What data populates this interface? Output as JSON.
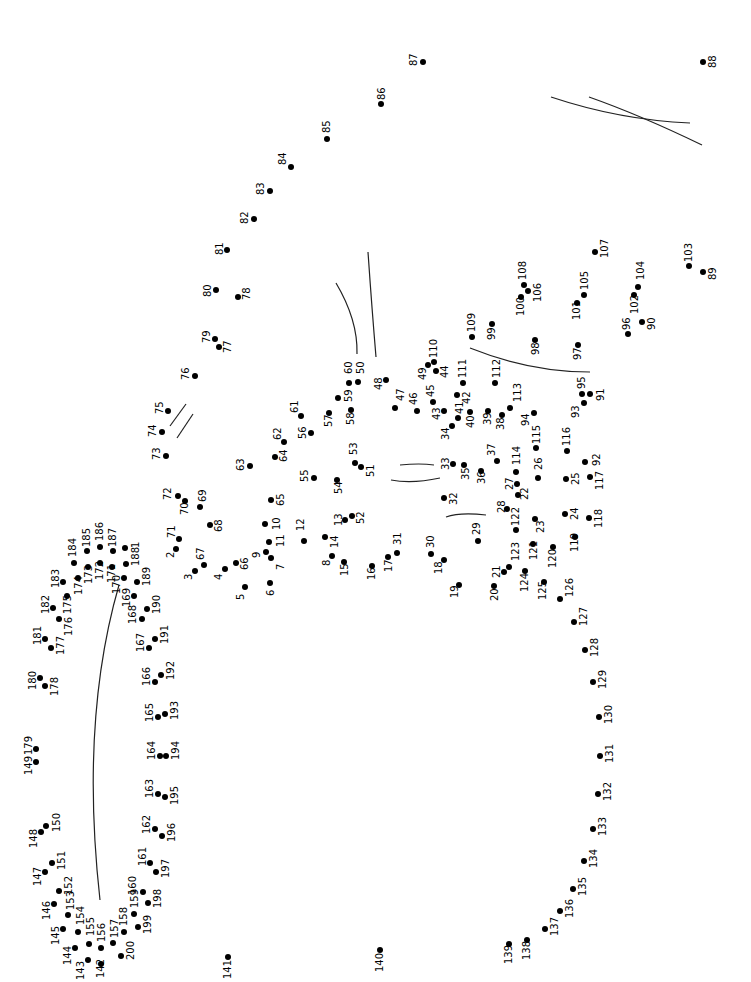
{
  "total_dots": 200,
  "colors": {
    "dot": "#000000",
    "line": "#222222",
    "background": "#ffffff"
  },
  "label_rotation_deg": -90,
  "dots": [
    {
      "n": "1",
      "x": 125,
      "y": 548,
      "lx": 131,
      "ly": 548
    },
    {
      "n": "2",
      "x": 176,
      "y": 549,
      "lx": 166,
      "ly": 558
    },
    {
      "n": "3",
      "x": 195,
      "y": 571,
      "lx": 184,
      "ly": 580
    },
    {
      "n": "4",
      "x": 225,
      "y": 569,
      "lx": 214,
      "ly": 580
    },
    {
      "n": "5",
      "x": 245,
      "y": 587,
      "lx": 236,
      "ly": 600
    },
    {
      "n": "6",
      "x": 270,
      "y": 583,
      "lx": 266,
      "ly": 596
    },
    {
      "n": "7",
      "x": 271,
      "y": 558,
      "lx": 276,
      "ly": 570
    },
    {
      "n": "8",
      "x": 332,
      "y": 556,
      "lx": 322,
      "ly": 566
    },
    {
      "n": "9",
      "x": 266,
      "y": 552,
      "lx": 252,
      "ly": 558
    },
    {
      "n": "10",
      "x": 265,
      "y": 524,
      "lx": 272,
      "ly": 530
    },
    {
      "n": "11",
      "x": 269,
      "y": 542,
      "lx": 276,
      "ly": 547
    },
    {
      "n": "12",
      "x": 304,
      "y": 541,
      "lx": 296,
      "ly": 531
    },
    {
      "n": "13",
      "x": 345,
      "y": 520,
      "lx": 334,
      "ly": 526
    },
    {
      "n": "14",
      "x": 325,
      "y": 537,
      "lx": 330,
      "ly": 548
    },
    {
      "n": "15",
      "x": 344,
      "y": 562,
      "lx": 340,
      "ly": 576
    },
    {
      "n": "16",
      "x": 372,
      "y": 566,
      "lx": 367,
      "ly": 580
    },
    {
      "n": "17",
      "x": 388,
      "y": 557,
      "lx": 384,
      "ly": 572
    },
    {
      "n": "18",
      "x": 444,
      "y": 560,
      "lx": 434,
      "ly": 574
    },
    {
      "n": "19",
      "x": 459,
      "y": 585,
      "lx": 450,
      "ly": 598
    },
    {
      "n": "20",
      "x": 494,
      "y": 586,
      "lx": 490,
      "ly": 601
    },
    {
      "n": "21",
      "x": 504,
      "y": 572,
      "lx": 492,
      "ly": 578
    },
    {
      "n": "22",
      "x": 518,
      "y": 495,
      "lx": 520,
      "ly": 500
    },
    {
      "n": "23",
      "x": 535,
      "y": 519,
      "lx": 536,
      "ly": 533
    },
    {
      "n": "24",
      "x": 565,
      "y": 514,
      "lx": 570,
      "ly": 520
    },
    {
      "n": "25",
      "x": 566,
      "y": 479,
      "lx": 571,
      "ly": 485
    },
    {
      "n": "26",
      "x": 538,
      "y": 478,
      "lx": 534,
      "ly": 470
    },
    {
      "n": "27",
      "x": 517,
      "y": 484,
      "lx": 505,
      "ly": 490
    },
    {
      "n": "28",
      "x": 507,
      "y": 509,
      "lx": 497,
      "ly": 513
    },
    {
      "n": "29",
      "x": 478,
      "y": 541,
      "lx": 472,
      "ly": 535
    },
    {
      "n": "30",
      "x": 431,
      "y": 554,
      "lx": 426,
      "ly": 548
    },
    {
      "n": "31",
      "x": 397,
      "y": 553,
      "lx": 393,
      "ly": 545
    },
    {
      "n": "32",
      "x": 444,
      "y": 498,
      "lx": 449,
      "ly": 505
    },
    {
      "n": "33",
      "x": 453,
      "y": 464,
      "lx": 441,
      "ly": 470
    },
    {
      "n": "34",
      "x": 452,
      "y": 426,
      "lx": 441,
      "ly": 440
    },
    {
      "n": "35",
      "x": 464,
      "y": 465,
      "lx": 461,
      "ly": 480
    },
    {
      "n": "36",
      "x": 481,
      "y": 471,
      "lx": 477,
      "ly": 484
    },
    {
      "n": "37",
      "x": 497,
      "y": 461,
      "lx": 487,
      "ly": 456
    },
    {
      "n": "38",
      "x": 502,
      "y": 415,
      "lx": 496,
      "ly": 430
    },
    {
      "n": "39",
      "x": 488,
      "y": 411,
      "lx": 483,
      "ly": 425
    },
    {
      "n": "40",
      "x": 470,
      "y": 412,
      "lx": 466,
      "ly": 428
    },
    {
      "n": "41",
      "x": 458,
      "y": 418,
      "lx": 455,
      "ly": 414
    },
    {
      "n": "42",
      "x": 457,
      "y": 395,
      "lx": 462,
      "ly": 404
    },
    {
      "n": "43",
      "x": 444,
      "y": 411,
      "lx": 432,
      "ly": 420
    },
    {
      "n": "44",
      "x": 436,
      "y": 371,
      "lx": 440,
      "ly": 378
    },
    {
      "n": "45",
      "x": 433,
      "y": 402,
      "lx": 426,
      "ly": 397
    },
    {
      "n": "46",
      "x": 417,
      "y": 411,
      "lx": 409,
      "ly": 405
    },
    {
      "n": "47",
      "x": 395,
      "y": 408,
      "lx": 396,
      "ly": 401
    },
    {
      "n": "48",
      "x": 386,
      "y": 380,
      "lx": 374,
      "ly": 390
    },
    {
      "n": "49",
      "x": 428,
      "y": 365,
      "lx": 418,
      "ly": 380
    },
    {
      "n": "50",
      "x": 358,
      "y": 382,
      "lx": 356,
      "ly": 374
    },
    {
      "n": "51",
      "x": 361,
      "y": 467,
      "lx": 366,
      "ly": 477
    },
    {
      "n": "52",
      "x": 352,
      "y": 516,
      "lx": 356,
      "ly": 524
    },
    {
      "n": "53",
      "x": 355,
      "y": 463,
      "lx": 349,
      "ly": 455
    },
    {
      "n": "54",
      "x": 337,
      "y": 480,
      "lx": 334,
      "ly": 494
    },
    {
      "n": "55",
      "x": 314,
      "y": 478,
      "lx": 300,
      "ly": 482
    },
    {
      "n": "56",
      "x": 311,
      "y": 433,
      "lx": 298,
      "ly": 439
    },
    {
      "n": "57",
      "x": 329,
      "y": 413,
      "lx": 324,
      "ly": 427
    },
    {
      "n": "58",
      "x": 351,
      "y": 410,
      "lx": 346,
      "ly": 425
    },
    {
      "n": "59",
      "x": 338,
      "y": 398,
      "lx": 344,
      "ly": 402
    },
    {
      "n": "60",
      "x": 349,
      "y": 383,
      "lx": 344,
      "ly": 374
    },
    {
      "n": "61",
      "x": 301,
      "y": 416,
      "lx": 290,
      "ly": 413
    },
    {
      "n": "62",
      "x": 284,
      "y": 442,
      "lx": 273,
      "ly": 440
    },
    {
      "n": "63",
      "x": 250,
      "y": 466,
      "lx": 236,
      "ly": 471
    },
    {
      "n": "64",
      "x": 275,
      "y": 457,
      "lx": 279,
      "ly": 462
    },
    {
      "n": "65",
      "x": 271,
      "y": 500,
      "lx": 276,
      "ly": 506
    },
    {
      "n": "66",
      "x": 236,
      "y": 563,
      "lx": 240,
      "ly": 570
    },
    {
      "n": "67",
      "x": 204,
      "y": 565,
      "lx": 196,
      "ly": 560
    },
    {
      "n": "68",
      "x": 210,
      "y": 525,
      "lx": 214,
      "ly": 532
    },
    {
      "n": "69",
      "x": 200,
      "y": 507,
      "lx": 198,
      "ly": 502
    },
    {
      "n": "70",
      "x": 185,
      "y": 501,
      "lx": 180,
      "ly": 515
    },
    {
      "n": "71",
      "x": 179,
      "y": 539,
      "lx": 167,
      "ly": 538
    },
    {
      "n": "72",
      "x": 178,
      "y": 496,
      "lx": 163,
      "ly": 500
    },
    {
      "n": "73",
      "x": 166,
      "y": 456,
      "lx": 152,
      "ly": 460
    },
    {
      "n": "74",
      "x": 162,
      "y": 432,
      "lx": 148,
      "ly": 437
    },
    {
      "n": "75",
      "x": 168,
      "y": 411,
      "lx": 155,
      "ly": 414
    },
    {
      "n": "76",
      "x": 195,
      "y": 376,
      "lx": 181,
      "ly": 380
    },
    {
      "n": "77",
      "x": 219,
      "y": 347,
      "lx": 223,
      "ly": 353
    },
    {
      "n": "78",
      "x": 238,
      "y": 297,
      "lx": 242,
      "ly": 300
    },
    {
      "n": "79",
      "x": 215,
      "y": 339,
      "lx": 202,
      "ly": 343
    },
    {
      "n": "80",
      "x": 216,
      "y": 290,
      "lx": 203,
      "ly": 297
    },
    {
      "n": "81",
      "x": 227,
      "y": 250,
      "lx": 215,
      "ly": 255
    },
    {
      "n": "82",
      "x": 254,
      "y": 219,
      "lx": 240,
      "ly": 224
    },
    {
      "n": "83",
      "x": 270,
      "y": 191,
      "lx": 256,
      "ly": 195
    },
    {
      "n": "84",
      "x": 291,
      "y": 167,
      "lx": 278,
      "ly": 165
    },
    {
      "n": "85",
      "x": 327,
      "y": 139,
      "lx": 322,
      "ly": 133
    },
    {
      "n": "86",
      "x": 381,
      "y": 104,
      "lx": 377,
      "ly": 100
    },
    {
      "n": "87",
      "x": 423,
      "y": 62,
      "lx": 409,
      "ly": 66
    },
    {
      "n": "88",
      "x": 703,
      "y": 62,
      "lx": 708,
      "ly": 68
    },
    {
      "n": "89",
      "x": 703,
      "y": 272,
      "lx": 708,
      "ly": 280
    },
    {
      "n": "90",
      "x": 642,
      "y": 322,
      "lx": 647,
      "ly": 330
    },
    {
      "n": "91",
      "x": 590,
      "y": 394,
      "lx": 596,
      "ly": 401
    },
    {
      "n": "92",
      "x": 585,
      "y": 462,
      "lx": 592,
      "ly": 466
    },
    {
      "n": "93",
      "x": 584,
      "y": 403,
      "lx": 571,
      "ly": 418
    },
    {
      "n": "94",
      "x": 534,
      "y": 413,
      "lx": 521,
      "ly": 426
    },
    {
      "n": "95",
      "x": 582,
      "y": 394,
      "lx": 577,
      "ly": 389
    },
    {
      "n": "96",
      "x": 628,
      "y": 334,
      "lx": 622,
      "ly": 330
    },
    {
      "n": "97",
      "x": 578,
      "y": 345,
      "lx": 573,
      "ly": 360
    },
    {
      "n": "98",
      "x": 535,
      "y": 340,
      "lx": 531,
      "ly": 355
    },
    {
      "n": "99",
      "x": 492,
      "y": 324,
      "lx": 487,
      "ly": 340
    },
    {
      "n": "100",
      "x": 521,
      "y": 297,
      "lx": 516,
      "ly": 316
    },
    {
      "n": "101",
      "x": 577,
      "y": 303,
      "lx": 572,
      "ly": 320
    },
    {
      "n": "102",
      "x": 634,
      "y": 295,
      "lx": 630,
      "ly": 314
    },
    {
      "n": "103",
      "x": 689,
      "y": 266,
      "lx": 684,
      "ly": 262
    },
    {
      "n": "104",
      "x": 638,
      "y": 287,
      "lx": 636,
      "ly": 280
    },
    {
      "n": "105",
      "x": 584,
      "y": 295,
      "lx": 580,
      "ly": 290
    },
    {
      "n": "106",
      "x": 528,
      "y": 291,
      "lx": 533,
      "ly": 302
    },
    {
      "n": "107",
      "x": 595,
      "y": 252,
      "lx": 600,
      "ly": 258
    },
    {
      "n": "108",
      "x": 524,
      "y": 285,
      "lx": 518,
      "ly": 280
    },
    {
      "n": "109",
      "x": 472,
      "y": 337,
      "lx": 467,
      "ly": 332
    },
    {
      "n": "110",
      "x": 434,
      "y": 362,
      "lx": 429,
      "ly": 358
    },
    {
      "n": "111",
      "x": 463,
      "y": 383,
      "lx": 458,
      "ly": 378
    },
    {
      "n": "112",
      "x": 495,
      "y": 383,
      "lx": 492,
      "ly": 378
    },
    {
      "n": "113",
      "x": 510,
      "y": 408,
      "lx": 513,
      "ly": 402
    },
    {
      "n": "114",
      "x": 516,
      "y": 472,
      "lx": 512,
      "ly": 465
    },
    {
      "n": "115",
      "x": 536,
      "y": 448,
      "lx": 532,
      "ly": 444
    },
    {
      "n": "116",
      "x": 567,
      "y": 451,
      "lx": 562,
      "ly": 446
    },
    {
      "n": "117",
      "x": 590,
      "y": 477,
      "lx": 595,
      "ly": 490
    },
    {
      "n": "118",
      "x": 589,
      "y": 518,
      "lx": 594,
      "ly": 528
    },
    {
      "n": "119",
      "x": 575,
      "y": 537,
      "lx": 570,
      "ly": 552
    },
    {
      "n": "120",
      "x": 553,
      "y": 547,
      "lx": 548,
      "ly": 568
    },
    {
      "n": "121",
      "x": 533,
      "y": 544,
      "lx": 529,
      "ly": 560
    },
    {
      "n": "122",
      "x": 516,
      "y": 530,
      "lx": 511,
      "ly": 526
    },
    {
      "n": "123",
      "x": 509,
      "y": 567,
      "lx": 511,
      "ly": 561
    },
    {
      "n": "124",
      "x": 525,
      "y": 571,
      "lx": 520,
      "ly": 592
    },
    {
      "n": "125",
      "x": 544,
      "y": 582,
      "lx": 538,
      "ly": 600
    },
    {
      "n": "126",
      "x": 560,
      "y": 599,
      "lx": 565,
      "ly": 597
    },
    {
      "n": "127",
      "x": 574,
      "y": 622,
      "lx": 579,
      "ly": 626
    },
    {
      "n": "128",
      "x": 585,
      "y": 650,
      "lx": 590,
      "ly": 657
    },
    {
      "n": "129",
      "x": 593,
      "y": 682,
      "lx": 598,
      "ly": 689
    },
    {
      "n": "130",
      "x": 599,
      "y": 717,
      "lx": 604,
      "ly": 724
    },
    {
      "n": "131",
      "x": 600,
      "y": 756,
      "lx": 605,
      "ly": 763
    },
    {
      "n": "132",
      "x": 598,
      "y": 794,
      "lx": 603,
      "ly": 801
    },
    {
      "n": "133",
      "x": 593,
      "y": 829,
      "lx": 598,
      "ly": 836
    },
    {
      "n": "134",
      "x": 584,
      "y": 861,
      "lx": 589,
      "ly": 868
    },
    {
      "n": "135",
      "x": 573,
      "y": 889,
      "lx": 578,
      "ly": 896
    },
    {
      "n": "136",
      "x": 560,
      "y": 911,
      "lx": 565,
      "ly": 918
    },
    {
      "n": "137",
      "x": 545,
      "y": 929,
      "lx": 550,
      "ly": 936
    },
    {
      "n": "138",
      "x": 527,
      "y": 940,
      "lx": 522,
      "ly": 960
    },
    {
      "n": "139",
      "x": 509,
      "y": 944,
      "lx": 504,
      "ly": 964
    },
    {
      "n": "140",
      "x": 380,
      "y": 950,
      "lx": 375,
      "ly": 972
    },
    {
      "n": "141",
      "x": 228,
      "y": 957,
      "lx": 223,
      "ly": 979
    },
    {
      "n": "142",
      "x": 101,
      "y": 964,
      "lx": 96,
      "ly": 978
    },
    {
      "n": "143",
      "x": 88,
      "y": 960,
      "lx": 76,
      "ly": 980
    },
    {
      "n": "144",
      "x": 75,
      "y": 948,
      "lx": 63,
      "ly": 965
    },
    {
      "n": "145",
      "x": 63,
      "y": 929,
      "lx": 51,
      "ly": 945
    },
    {
      "n": "146",
      "x": 54,
      "y": 904,
      "lx": 42,
      "ly": 920
    },
    {
      "n": "147",
      "x": 45,
      "y": 872,
      "lx": 33,
      "ly": 886
    },
    {
      "n": "148",
      "x": 41,
      "y": 832,
      "lx": 29,
      "ly": 848
    },
    {
      "n": "149",
      "x": 36,
      "y": 762,
      "lx": 24,
      "ly": 775
    },
    {
      "n": "150",
      "x": 46,
      "y": 826,
      "lx": 52,
      "ly": 832
    },
    {
      "n": "151",
      "x": 52,
      "y": 863,
      "lx": 57,
      "ly": 870
    },
    {
      "n": "152",
      "x": 59,
      "y": 891,
      "lx": 64,
      "ly": 895
    },
    {
      "n": "153",
      "x": 68,
      "y": 915,
      "lx": 66,
      "ly": 910
    },
    {
      "n": "154",
      "x": 78,
      "y": 932,
      "lx": 76,
      "ly": 925
    },
    {
      "n": "155",
      "x": 89,
      "y": 944,
      "lx": 86,
      "ly": 936
    },
    {
      "n": "156",
      "x": 101,
      "y": 948,
      "lx": 97,
      "ly": 942
    },
    {
      "n": "157",
      "x": 113,
      "y": 943,
      "lx": 110,
      "ly": 938
    },
    {
      "n": "158",
      "x": 124,
      "y": 932,
      "lx": 119,
      "ly": 926
    },
    {
      "n": "159",
      "x": 134,
      "y": 914,
      "lx": 130,
      "ly": 908
    },
    {
      "n": "160",
      "x": 143,
      "y": 892,
      "lx": 128,
      "ly": 895
    },
    {
      "n": "161",
      "x": 150,
      "y": 863,
      "lx": 138,
      "ly": 866
    },
    {
      "n": "162",
      "x": 155,
      "y": 829,
      "lx": 142,
      "ly": 834
    },
    {
      "n": "163",
      "x": 158,
      "y": 794,
      "lx": 145,
      "ly": 798
    },
    {
      "n": "164",
      "x": 160,
      "y": 756,
      "lx": 147,
      "ly": 760
    },
    {
      "n": "165",
      "x": 158,
      "y": 717,
      "lx": 145,
      "ly": 722
    },
    {
      "n": "166",
      "x": 155,
      "y": 682,
      "lx": 142,
      "ly": 686
    },
    {
      "n": "167",
      "x": 149,
      "y": 648,
      "lx": 136,
      "ly": 652
    },
    {
      "n": "168",
      "x": 142,
      "y": 619,
      "lx": 128,
      "ly": 624
    },
    {
      "n": "169",
      "x": 134,
      "y": 596,
      "lx": 122,
      "ly": 607
    },
    {
      "n": "170",
      "x": 124,
      "y": 578,
      "lx": 112,
      "ly": 594
    },
    {
      "n": "171",
      "x": 112,
      "y": 567,
      "lx": 107,
      "ly": 583
    },
    {
      "n": "172",
      "x": 100,
      "y": 563,
      "lx": 95,
      "ly": 580
    },
    {
      "n": "173",
      "x": 88,
      "y": 567,
      "lx": 84,
      "ly": 584
    },
    {
      "n": "174",
      "x": 78,
      "y": 578,
      "lx": 74,
      "ly": 595
    },
    {
      "n": "175",
      "x": 67,
      "y": 596,
      "lx": 63,
      "ly": 614
    },
    {
      "n": "176",
      "x": 59,
      "y": 619,
      "lx": 64,
      "ly": 636
    },
    {
      "n": "177",
      "x": 51,
      "y": 648,
      "lx": 56,
      "ly": 655
    },
    {
      "n": "178",
      "x": 45,
      "y": 686,
      "lx": 50,
      "ly": 696
    },
    {
      "n": "179",
      "x": 36,
      "y": 749,
      "lx": 24,
      "ly": 755
    },
    {
      "n": "180",
      "x": 40,
      "y": 678,
      "lx": 28,
      "ly": 690
    },
    {
      "n": "181",
      "x": 45,
      "y": 639,
      "lx": 33,
      "ly": 645
    },
    {
      "n": "182",
      "x": 53,
      "y": 608,
      "lx": 41,
      "ly": 614
    },
    {
      "n": "183",
      "x": 63,
      "y": 582,
      "lx": 51,
      "ly": 588
    },
    {
      "n": "184",
      "x": 74,
      "y": 563,
      "lx": 68,
      "ly": 557
    },
    {
      "n": "185",
      "x": 87,
      "y": 551,
      "lx": 82,
      "ly": 547
    },
    {
      "n": "186",
      "x": 100,
      "y": 547,
      "lx": 95,
      "ly": 541
    },
    {
      "n": "187",
      "x": 113,
      "y": 551,
      "lx": 108,
      "ly": 547
    },
    {
      "n": "188",
      "x": 126,
      "y": 564,
      "lx": 131,
      "ly": 566
    },
    {
      "n": "189",
      "x": 137,
      "y": 582,
      "lx": 142,
      "ly": 586
    },
    {
      "n": "190",
      "x": 147,
      "y": 609,
      "lx": 152,
      "ly": 614
    },
    {
      "n": "191",
      "x": 155,
      "y": 639,
      "lx": 160,
      "ly": 644
    },
    {
      "n": "192",
      "x": 161,
      "y": 675,
      "lx": 166,
      "ly": 680
    },
    {
      "n": "193",
      "x": 165,
      "y": 714,
      "lx": 170,
      "ly": 720
    },
    {
      "n": "194",
      "x": 166,
      "y": 756,
      "lx": 171,
      "ly": 760
    },
    {
      "n": "195",
      "x": 165,
      "y": 797,
      "lx": 170,
      "ly": 805
    },
    {
      "n": "196",
      "x": 162,
      "y": 836,
      "lx": 167,
      "ly": 842
    },
    {
      "n": "197",
      "x": 156,
      "y": 872,
      "lx": 161,
      "ly": 878
    },
    {
      "n": "198",
      "x": 148,
      "y": 903,
      "lx": 153,
      "ly": 908
    },
    {
      "n": "199",
      "x": 138,
      "y": 927,
      "lx": 143,
      "ly": 934
    },
    {
      "n": "200",
      "x": 121,
      "y": 956,
      "lx": 126,
      "ly": 960
    }
  ],
  "guide_lines": [
    "M 551 97 Q 620 120 690 123",
    "M 589 97 Q 640 115 702 145",
    "M 336 283 Q 358 320 357 354",
    "M 368 252 Q 372 310 376 357",
    "M 470 348 Q 530 372 590 372",
    "M 170 426 Q 178 415 186 404",
    "M 177 438 Q 185 426 193 414",
    "M 400 465 Q 420 463 434 465",
    "M 391 480 Q 412 484 440 478",
    "M 446 517 Q 460 512 486 515",
    "M 119 585 Q 80 720 100 900"
  ]
}
